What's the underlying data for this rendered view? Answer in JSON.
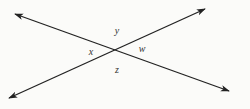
{
  "diagram": {
    "type": "intersecting-lines",
    "colors": {
      "background": "#fbfbf9",
      "line": "#222222",
      "label": "#333333"
    },
    "intersection": {
      "x": 117,
      "y": 51
    },
    "lines": [
      {
        "name": "line-1",
        "from": {
          "x": 15,
          "y": 14
        },
        "to": {
          "x": 229,
          "y": 91
        },
        "arrows": "both"
      },
      {
        "name": "line-2",
        "from": {
          "x": 9,
          "y": 98
        },
        "to": {
          "x": 205,
          "y": 9
        },
        "arrows": "both"
      }
    ],
    "labels": {
      "y": "y",
      "x": "x",
      "w": "w",
      "z": "z"
    }
  }
}
